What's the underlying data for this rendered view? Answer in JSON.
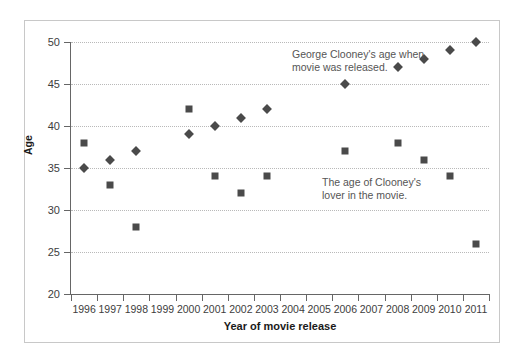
{
  "chart_data": {
    "type": "scatter",
    "title": "",
    "xlabel": "Year of movie release",
    "ylabel": "Age",
    "ylim": [
      20,
      50
    ],
    "y_ticks": [
      20,
      25,
      30,
      35,
      40,
      45,
      50
    ],
    "grid": true,
    "legend_position": "none",
    "categories": [
      "1996",
      "1997",
      "1998",
      "1999",
      "2000",
      "2001",
      "2002",
      "2003",
      "2004",
      "2005",
      "2006",
      "2007",
      "2008",
      "2009",
      "2010",
      "2011"
    ],
    "series": [
      {
        "name": "George Clooney's age when movie was released.",
        "marker": "diamond",
        "color": "#4a4a4a",
        "points": [
          {
            "x": "1996",
            "y": 35
          },
          {
            "x": "1997",
            "y": 36
          },
          {
            "x": "1998",
            "y": 37
          },
          {
            "x": "2000",
            "y": 39
          },
          {
            "x": "2001",
            "y": 40
          },
          {
            "x": "2002",
            "y": 41
          },
          {
            "x": "2003",
            "y": 42
          },
          {
            "x": "2006",
            "y": 45
          },
          {
            "x": "2008",
            "y": 47
          },
          {
            "x": "2009",
            "y": 48
          },
          {
            "x": "2010",
            "y": 49
          },
          {
            "x": "2011",
            "y": 50
          }
        ]
      },
      {
        "name": "The age of Clooney's lover in the movie.",
        "marker": "square",
        "color": "#4a4a4a",
        "points": [
          {
            "x": "1996",
            "y": 38
          },
          {
            "x": "1997",
            "y": 33
          },
          {
            "x": "1998",
            "y": 28
          },
          {
            "x": "2000",
            "y": 42
          },
          {
            "x": "2001",
            "y": 34
          },
          {
            "x": "2002",
            "y": 32
          },
          {
            "x": "2003",
            "y": 34
          },
          {
            "x": "2006",
            "y": 37
          },
          {
            "x": "2008",
            "y": 38
          },
          {
            "x": "2009",
            "y": 36
          },
          {
            "x": "2010",
            "y": 34
          },
          {
            "x": "2011",
            "y": 26
          }
        ]
      }
    ],
    "annotations": [
      {
        "id": "clooney",
        "text": "George Clooney's age when\nmovie was released."
      },
      {
        "id": "lover",
        "text": "The age of Clooney's\nlover in the movie."
      }
    ]
  },
  "colors": {
    "marker": "#4a4a4a",
    "gridline": "#b9b9b9",
    "axis": "#666666",
    "frame": "#c8c8c8",
    "annotation_text": "#555555",
    "tick_text": "#3d3d3d",
    "axis_title_text": "#1a1a1a"
  }
}
